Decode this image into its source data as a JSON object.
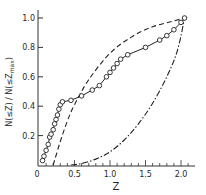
{
  "chart_data": {
    "type": "line",
    "title": "",
    "xlabel": "Z",
    "ylabel": "N(≤Z) / N(≤Z_max)",
    "xlim": [
      0,
      2.2
    ],
    "ylim": [
      0,
      1.05
    ],
    "x_ticks": [
      0,
      0.5,
      1.0,
      1.5,
      2.0
    ],
    "x_tick_labels": [
      "0",
      "0.5",
      "1.0",
      "1.5",
      "2.0"
    ],
    "y_ticks": [
      0.2,
      0.4,
      0.6,
      0.8,
      1.0
    ],
    "y_tick_labels": [
      "0.2",
      "0.4",
      "0.6",
      "0.8",
      "1.0"
    ],
    "grid": false,
    "legend": null,
    "series": [
      {
        "name": "observed",
        "style": "solid line with open circles",
        "x": [
          0.05,
          0.07,
          0.1,
          0.13,
          0.15,
          0.17,
          0.2,
          0.22,
          0.24,
          0.26,
          0.28,
          0.3,
          0.33,
          0.45,
          0.6,
          0.75,
          0.85,
          0.95,
          1.0,
          1.05,
          1.1,
          1.15,
          1.25,
          1.5,
          1.7,
          1.8,
          1.9,
          2.0,
          2.05
        ],
        "y": [
          0.03,
          0.06,
          0.1,
          0.14,
          0.19,
          0.21,
          0.24,
          0.28,
          0.31,
          0.34,
          0.38,
          0.41,
          0.43,
          0.44,
          0.47,
          0.51,
          0.54,
          0.6,
          0.63,
          0.66,
          0.69,
          0.72,
          0.75,
          0.8,
          0.85,
          0.88,
          0.92,
          0.97,
          1.0
        ]
      },
      {
        "name": "model-dashed",
        "style": "dashed",
        "x": [
          0.2,
          0.3,
          0.4,
          0.5,
          0.7,
          1.0,
          1.3,
          1.6,
          1.9,
          2.05
        ],
        "y": [
          0.0,
          0.16,
          0.3,
          0.41,
          0.58,
          0.76,
          0.87,
          0.94,
          0.98,
          1.0
        ]
      },
      {
        "name": "model-dash-dot",
        "style": "dash-dot",
        "x": [
          0.45,
          0.6,
          0.8,
          1.0,
          1.2,
          1.4,
          1.6,
          1.8,
          1.95,
          2.05
        ],
        "y": [
          0.0,
          0.01,
          0.04,
          0.09,
          0.17,
          0.28,
          0.42,
          0.6,
          0.78,
          1.0
        ]
      }
    ]
  },
  "labels": {
    "xlabel": "Z",
    "ylabel": "N(≤Z) / N(≤Z",
    "ylabel_sub": "max",
    "ylabel_close": ")"
  }
}
